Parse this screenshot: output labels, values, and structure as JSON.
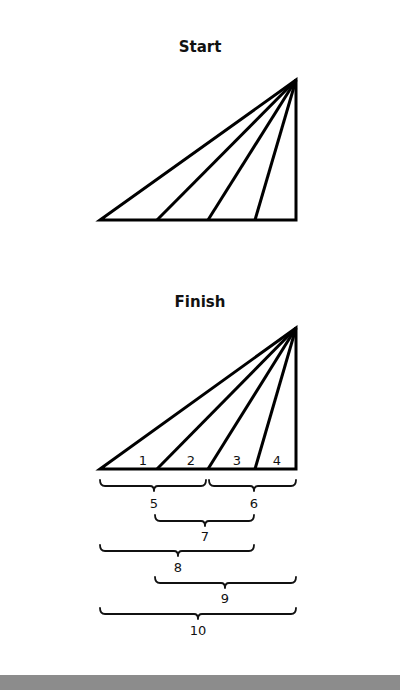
{
  "diagram": {
    "start": {
      "title": "Start",
      "apex": [
        296,
        80
      ],
      "base_y": 220,
      "base_points_x": [
        100,
        157,
        208,
        255,
        296
      ]
    },
    "finish": {
      "title": "Finish",
      "apex": [
        296,
        328
      ],
      "base_y": 469,
      "base_points_x": [
        100,
        157,
        208,
        255,
        296
      ],
      "triangle_labels": [
        {
          "text": "1",
          "x": 143,
          "y": 465
        },
        {
          "text": "2",
          "x": 191,
          "y": 465
        },
        {
          "text": "3",
          "x": 237,
          "y": 465
        },
        {
          "text": "4",
          "x": 277,
          "y": 465
        }
      ],
      "braces": [
        {
          "label": "5",
          "x1": 100,
          "x2": 206,
          "y": 480,
          "tip": 154,
          "label_y": 508
        },
        {
          "label": "6",
          "x1": 209,
          "x2": 296,
          "y": 480,
          "tip": 254,
          "label_y": 508
        },
        {
          "label": "7",
          "x1": 155,
          "x2": 254,
          "y": 515,
          "tip": 205,
          "label_y": 541
        },
        {
          "label": "8",
          "x1": 100,
          "x2": 254,
          "y": 545,
          "tip": 178,
          "label_y": 572
        },
        {
          "label": "9",
          "x1": 155,
          "x2": 296,
          "y": 577,
          "tip": 225,
          "label_y": 603
        },
        {
          "label": "10",
          "x1": 100,
          "x2": 296,
          "y": 608,
          "tip": 198,
          "label_y": 635
        }
      ]
    },
    "colors": {
      "stroke": "#000000",
      "footer_bar": "#8c8c8c"
    }
  }
}
